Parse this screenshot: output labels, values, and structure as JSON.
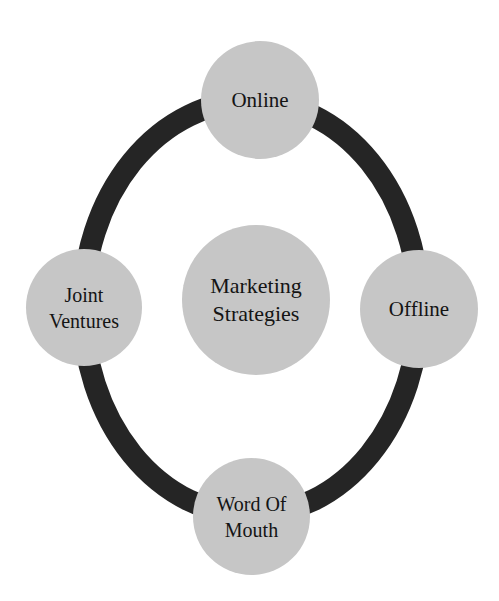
{
  "diagram": {
    "type": "cycle",
    "center": {
      "label": "Marketing\nStrategies"
    },
    "nodes": [
      {
        "id": "online",
        "label": "Online"
      },
      {
        "id": "offline",
        "label": "Offline"
      },
      {
        "id": "word_of_mouth",
        "label": "Word Of\nMouth"
      },
      {
        "id": "joint_ventures",
        "label": "Joint\nVentures"
      }
    ],
    "colors": {
      "ring": "#252525",
      "node_fill": "#c6c6c6",
      "text": "#141414",
      "background": "#ffffff"
    }
  }
}
